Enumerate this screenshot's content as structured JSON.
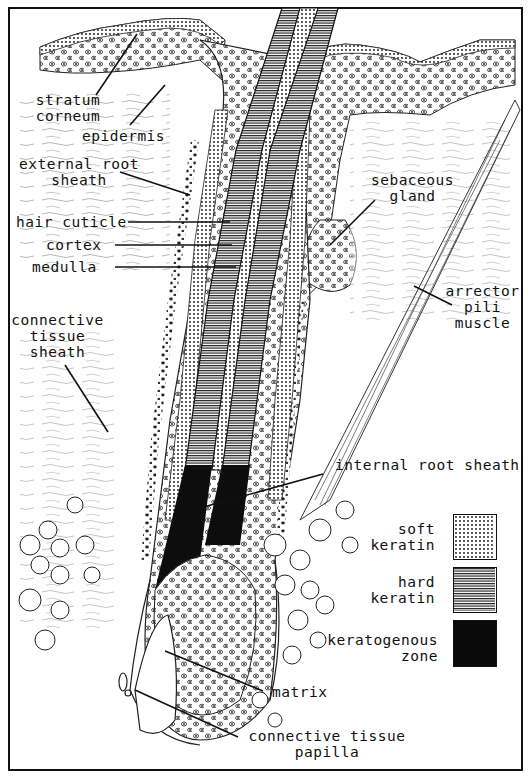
{
  "diagram": {
    "labels": {
      "stratum_corneum": "stratum\ncorneum",
      "epidermis": "epidermis",
      "external_root_sheath": "external root\nsheath",
      "hair_cuticle": "hair cuticle",
      "cortex": "cortex",
      "medulla": "medulla",
      "connective_tissue_sheath": "connective\ntissue\nsheath",
      "sebaceous_gland": "sebaceous\ngland",
      "arrector_pili_muscle": "arrector\npili\nmuscle",
      "internal_root_sheath": "internal root sheath",
      "matrix": "matrix",
      "connective_tissue_papilla": "connective tissue\npapilla"
    },
    "legend": [
      {
        "label": "soft\nkeratin",
        "pattern": "dots"
      },
      {
        "label": "hard\nkeratin",
        "pattern": "horizontal-lines"
      },
      {
        "label": "keratogenous\nzone",
        "pattern": "solid-black"
      }
    ],
    "colors": {
      "ink": "#111111",
      "paper": "#ffffff"
    }
  }
}
